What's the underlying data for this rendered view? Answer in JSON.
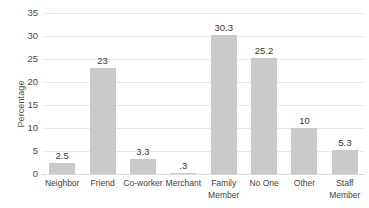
{
  "chart_data": {
    "type": "bar",
    "title": "",
    "xlabel": "",
    "ylabel": "Percentage",
    "categories": [
      "Neighbor",
      "Friend",
      "Co-worker",
      "Merchant",
      "Family Member",
      "No One",
      "Other",
      "Staff Member"
    ],
    "values": [
      2.5,
      23,
      3.3,
      0.3,
      30.3,
      25.2,
      10,
      5.3
    ],
    "point_labels": [
      "2.5",
      "23",
      "3.3",
      ".3",
      "30.3",
      "25.2",
      "10",
      "5.3"
    ],
    "ylim": [
      0,
      35
    ],
    "ytick_labels": [
      "0",
      "5",
      "10",
      "15",
      "20",
      "25",
      "30",
      "35"
    ],
    "ytick_values": [
      0,
      5,
      10,
      15,
      20,
      25,
      30,
      35
    ],
    "grid": "horizontal",
    "legend": "none",
    "bar_color": "#c9c9c9",
    "gridline_color": "#e9e9e9",
    "background_color": "#ffffff"
  }
}
